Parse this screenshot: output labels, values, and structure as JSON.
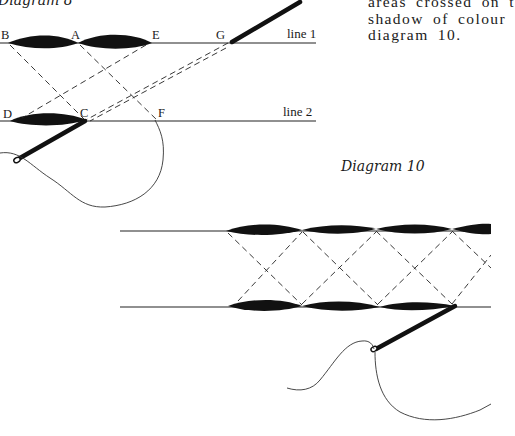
{
  "diagram8": {
    "caption": "Diagram 8",
    "labels": {
      "b": "B",
      "a": "A",
      "e": "E",
      "g": "G",
      "d": "D",
      "c": "C",
      "f": "F"
    },
    "line1_label": "line 1",
    "line2_label": "line 2"
  },
  "diagram10": {
    "caption": "Diagram 10"
  },
  "body_text": {
    "lines": [
      "areas crossed on t",
      "shadow of colour",
      "diagram 10."
    ]
  },
  "colors": {
    "ink": "#111111",
    "background": "#ffffff"
  }
}
